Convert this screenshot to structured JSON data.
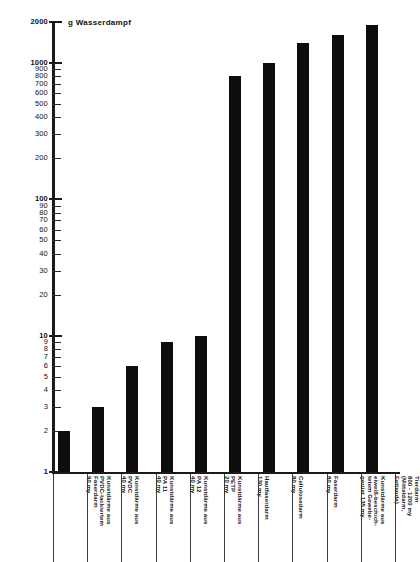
{
  "chart_data": {
    "type": "bar",
    "title": "g Wasserdampf",
    "xlabel": "",
    "ylabel": "g Wasserdampf",
    "yscale": "log",
    "ylim": [
      1,
      2000
    ],
    "grid": false,
    "legend": null,
    "ytick_labels": [
      "2000",
      "1000",
      "900",
      "800",
      "700",
      "600",
      "500",
      "400",
      "300",
      "200",
      "100",
      "90",
      "80",
      "70",
      "60",
      "50",
      "40",
      "30",
      "20",
      "10",
      "9",
      "8",
      "7",
      "6",
      "5",
      "4",
      "3",
      "2",
      "1"
    ],
    "ytick_values": [
      2000,
      1000,
      900,
      800,
      700,
      600,
      500,
      400,
      300,
      200,
      100,
      90,
      80,
      70,
      60,
      50,
      40,
      30,
      20,
      10,
      9,
      8,
      7,
      6,
      5,
      4,
      3,
      2,
      1
    ],
    "ytick_major": [
      2000,
      1000,
      100,
      10,
      1
    ],
    "categories": [
      "Kunstdärme aus PVDC/PVDC-lackiertem Faserdarm 90 my",
      "Kunstdärme aus PVDC 40 my",
      "Kunstdärme aus PA 11 40 my",
      "Kunstdärme aus PA 12 40 my",
      "Kunstdärme aus PETP 20 my",
      "Hautfaserdarm 130 my",
      "Cellulosedarm 80 my",
      "Faserdarm 80 my",
      "Kunstdärme aus eiweiß-beschichtetem Gewebe-gerüst 135 my",
      "Tierdarm 800 - 1200 my (Mitteldarm, Fettende)"
    ],
    "category_lines": [
      "Kunstdärme aus\nPVDC-lackiertem\nFaserdarm\n90 my",
      "Kunstdärme aus\nPVDC\n40 my",
      "Kunstdärme aus\nPA 11\n40 my",
      "Kunstdärme aus\nPA 12\n40 my",
      "Kunstdärme aus\nPETP\n20 my",
      "Hautfaserdarm\n130 my",
      "Cellulosedarm\n80 my",
      "Faserdarm\n80 my",
      "Kunstdärme aus\neiweiß-beschich-\ntetem Gewebe-\ngerüst 135 my",
      "Tierdarm\n800 - 1200 my\n(Mitteldarm,\nFettende)"
    ],
    "values": [
      2,
      3,
      6,
      9,
      10,
      800,
      1000,
      1400,
      1600,
      1900
    ],
    "bar_color": "#0d0d0d",
    "axis_color": "#1a1a1a"
  }
}
